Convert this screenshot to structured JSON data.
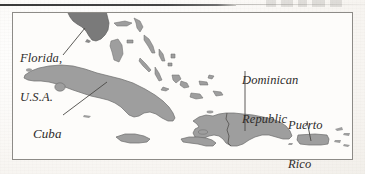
{
  "figure": {
    "kind": "map",
    "region": "Caribbean Sea and surrounding islands",
    "background_color": "#fbfaf8",
    "frame_color": "#8d8b87",
    "rule_color": "#3a3a3a"
  },
  "map": {
    "land_fill_light": "#9e9e9e",
    "land_fill_dark": "#7a7a7a",
    "land_stroke": "#6b6b6b",
    "water_fill": "#fdfcfa",
    "leader_line_color": "#4a4845",
    "labels": [
      {
        "id": "florida",
        "name": "florida-usa",
        "line1": "Florida,",
        "line2": "U.S.A.",
        "leader": "diagonal-up-right"
      },
      {
        "id": "cuba",
        "name": "cuba",
        "line1": "Cuba",
        "line2": "",
        "leader": "diagonal-up-right"
      },
      {
        "id": "dominican-republic",
        "name": "dominican-republic",
        "line1": "Dominican",
        "line2": "Republic",
        "leader": "vertical-down"
      },
      {
        "id": "puerto-rico",
        "name": "puerto-rico",
        "line1": "Puerto",
        "line2": "Rico",
        "leader": "vertical-down"
      }
    ],
    "landmasses": [
      "Florida peninsula",
      "Cuba",
      "Bahamas chain",
      "Hispaniola (Haiti and Dominican Republic)",
      "Jamaica",
      "Puerto Rico",
      "Virgin Islands"
    ]
  }
}
